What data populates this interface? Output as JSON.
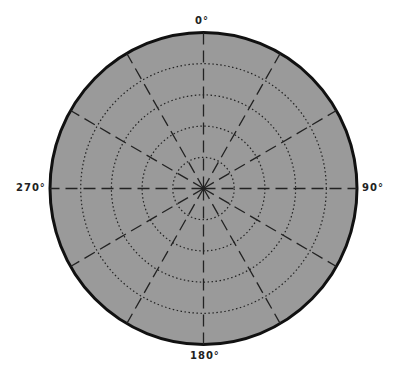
{
  "chart_data": {
    "type": "polar",
    "title": "",
    "angular_labels": [
      "0°",
      "90°",
      "180°",
      "270°"
    ],
    "angular_direction": "clockwise",
    "zero_location": "top",
    "spoke_interval_deg": 30,
    "spokes_deg": [
      0,
      30,
      60,
      90,
      120,
      150,
      180,
      210,
      240,
      270,
      300,
      330
    ],
    "radial_rings": 4,
    "radial_ring_fraction": [
      0.2,
      0.4,
      0.6,
      0.8
    ],
    "series": [],
    "grid": true,
    "colors": {
      "background": "#9a9a9a",
      "border": "#111111",
      "grid": "#222222"
    }
  },
  "labels": {
    "top": "0°",
    "right": "90°",
    "bottom": "180°",
    "left": "270°"
  }
}
